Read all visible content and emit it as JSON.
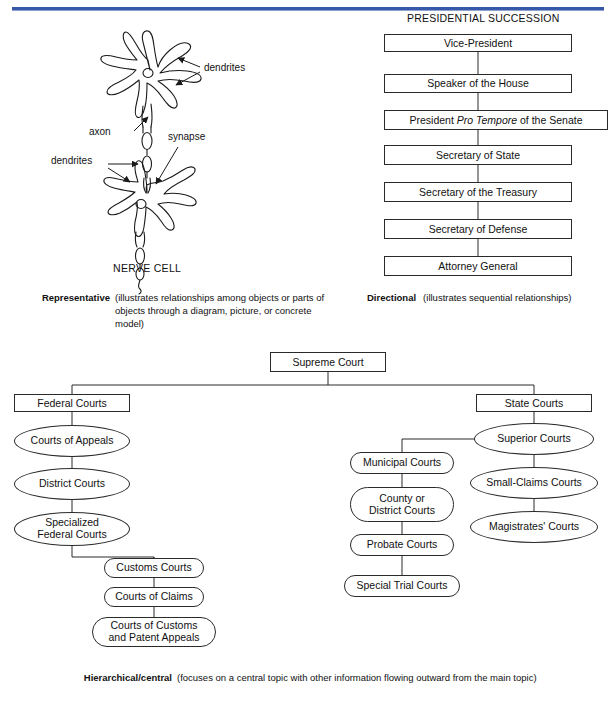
{
  "page": {
    "accent_color": "#3558a8",
    "line_color": "#2a2a2a",
    "background": "#ffffff"
  },
  "nerve_cell": {
    "title": "NERVE CELL",
    "annotations": [
      {
        "name": "dendrites-upper",
        "label": "dendrites"
      },
      {
        "name": "axon",
        "label": "axon"
      },
      {
        "name": "synapse",
        "label": "synapse"
      },
      {
        "name": "dendrites-lower",
        "label": "dendrites"
      }
    ]
  },
  "presidential_succession": {
    "title": "PRESIDENTIAL SUCCESSION",
    "items": [
      {
        "label": "Vice-President",
        "italic_part": ""
      },
      {
        "label": "Speaker of the House",
        "italic_part": ""
      },
      {
        "label": "President Pro Tempore of the Senate",
        "italic_part": "Pro Tempore"
      },
      {
        "label": "Secretary of State",
        "italic_part": ""
      },
      {
        "label": "Secretary of the Treasury",
        "italic_part": ""
      },
      {
        "label": "Secretary of Defense",
        "italic_part": ""
      },
      {
        "label": "Attorney General",
        "italic_part": ""
      }
    ]
  },
  "captions": {
    "representative": {
      "term": "Representative",
      "body": "(illustrates relationships among objects or parts of objects through a diagram, picture, or concrete model)"
    },
    "directional": {
      "term": "Directional",
      "body": "(illustrates sequential relationships)"
    },
    "hierarchical": {
      "term": "Hierarchical/central",
      "body": "(focuses on a central topic with other information flowing outward from the main topic)"
    }
  },
  "court_system": {
    "root": "Supreme Court",
    "federal": {
      "head": "Federal Courts",
      "nodes": [
        "Courts of Appeals",
        "District Courts",
        "Specialized\nFederal Courts"
      ],
      "branch": [
        "Customs Courts",
        "Courts of Claims",
        "Courts of Customs\nand Patent Appeals"
      ]
    },
    "state": {
      "head": "State Courts",
      "nodes": [
        "Superior Courts",
        "Small-Claims Courts",
        "Magistrates' Courts"
      ],
      "branch": [
        "Municipal Courts",
        "County or\nDistrict Courts",
        "Probate Courts",
        "Special Trial Courts"
      ]
    }
  }
}
